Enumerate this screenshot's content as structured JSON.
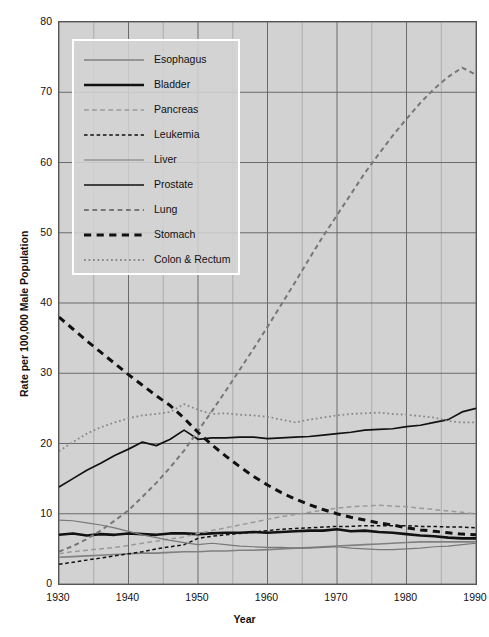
{
  "chart_data": {
    "type": "line",
    "title": "",
    "xlabel": "Year",
    "ylabel": "Rate per 100,000 Male Population",
    "xlim": [
      1930,
      1990
    ],
    "ylim": [
      0,
      80
    ],
    "xticks": [
      "1930",
      "1940",
      "1950",
      "1960",
      "1970",
      "1980",
      "1990"
    ],
    "yticks": [
      "0",
      "10",
      "20",
      "30",
      "40",
      "50",
      "60",
      "70",
      "80"
    ],
    "x_minor_step": 5,
    "grid": true,
    "legend_position": "upper-left",
    "background_color": "#d2d2d2",
    "grid_color": "#6a6a6a",
    "x": [
      1930,
      1932,
      1934,
      1936,
      1938,
      1940,
      1942,
      1944,
      1946,
      1948,
      1950,
      1952,
      1954,
      1956,
      1958,
      1960,
      1962,
      1964,
      1966,
      1968,
      1970,
      1972,
      1974,
      1976,
      1978,
      1980,
      1982,
      1984,
      1986,
      1988,
      1990
    ],
    "series": [
      {
        "name": "Esophagus",
        "style": "solid",
        "width": 1.6,
        "color": "#808080",
        "values": [
          3.8,
          3.9,
          4.0,
          4.1,
          4.2,
          4.3,
          4.4,
          4.4,
          4.5,
          4.6,
          4.6,
          4.7,
          4.7,
          4.8,
          4.8,
          4.9,
          5.0,
          5.1,
          5.2,
          5.3,
          5.4,
          5.5,
          5.6,
          5.7,
          5.8,
          5.9,
          6.0,
          6.0,
          6.0,
          6.0,
          6.0
        ]
      },
      {
        "name": "Bladder",
        "style": "solid",
        "width": 2.6,
        "color": "#111111",
        "values": [
          7.0,
          7.2,
          6.9,
          7.1,
          7.0,
          7.2,
          7.1,
          7.0,
          7.2,
          7.2,
          7.1,
          7.2,
          7.3,
          7.3,
          7.4,
          7.3,
          7.4,
          7.5,
          7.6,
          7.6,
          7.8,
          7.5,
          7.6,
          7.4,
          7.3,
          7.1,
          6.9,
          6.8,
          6.6,
          6.5,
          6.5
        ]
      },
      {
        "name": "Pancreas",
        "style": "dashed-thin",
        "width": 1.5,
        "color": "#9a9a9a",
        "values": [
          4.3,
          4.6,
          4.8,
          5.0,
          5.2,
          5.5,
          5.8,
          6.1,
          6.4,
          6.7,
          7.2,
          7.6,
          8.0,
          8.4,
          8.8,
          9.2,
          9.6,
          9.9,
          10.2,
          10.5,
          10.8,
          11.0,
          11.1,
          11.2,
          11.1,
          11.0,
          10.8,
          10.6,
          10.4,
          10.2,
          10.0
        ]
      },
      {
        "name": "Leukemia",
        "style": "dashed",
        "width": 1.5,
        "color": "#111111",
        "values": [
          2.8,
          3.1,
          3.4,
          3.7,
          4.0,
          4.3,
          4.6,
          5.0,
          5.3,
          5.6,
          6.5,
          6.8,
          7.0,
          7.2,
          7.4,
          7.6,
          7.8,
          7.9,
          8.0,
          8.1,
          8.2,
          8.2,
          8.3,
          8.3,
          8.3,
          8.3,
          8.2,
          8.2,
          8.1,
          8.1,
          8.0
        ]
      },
      {
        "name": "Liver",
        "style": "solid",
        "width": 1.2,
        "color": "#787878",
        "values": [
          9.1,
          9.0,
          8.7,
          8.4,
          8.0,
          7.5,
          7.0,
          6.6,
          6.2,
          5.9,
          5.6,
          5.8,
          5.6,
          5.4,
          5.3,
          5.2,
          5.2,
          5.1,
          5.1,
          5.2,
          5.3,
          5.1,
          5.0,
          4.9,
          4.9,
          5.0,
          5.1,
          5.3,
          5.4,
          5.6,
          5.8
        ]
      },
      {
        "name": "Prostate",
        "style": "solid",
        "width": 1.7,
        "color": "#111111",
        "values": [
          13.8,
          15.0,
          16.2,
          17.2,
          18.3,
          19.2,
          20.2,
          19.7,
          20.6,
          21.9,
          20.6,
          20.8,
          20.8,
          20.9,
          20.9,
          20.7,
          20.8,
          20.9,
          21.0,
          21.2,
          21.4,
          21.6,
          21.9,
          22.0,
          22.1,
          22.4,
          22.6,
          23.0,
          23.4,
          24.5,
          25.0
        ]
      },
      {
        "name": "Lung",
        "style": "dashed",
        "width": 2.0,
        "color": "#777777",
        "values": [
          4.6,
          5.4,
          6.4,
          7.6,
          9.0,
          10.5,
          12.4,
          14.4,
          16.6,
          19.0,
          21.8,
          24.6,
          27.5,
          30.5,
          33.5,
          36.6,
          39.8,
          43.0,
          46.3,
          49.5,
          52.5,
          55.5,
          58.5,
          61.2,
          63.8,
          66.2,
          68.5,
          70.5,
          72.2,
          73.5,
          72.5
        ]
      },
      {
        "name": "Stomach",
        "style": "dashed",
        "width": 3.0,
        "color": "#111111",
        "values": [
          38.0,
          36.3,
          34.6,
          33.0,
          31.4,
          29.8,
          28.3,
          26.8,
          25.4,
          23.6,
          21.6,
          19.8,
          18.2,
          16.7,
          15.3,
          14.1,
          13.0,
          12.1,
          11.3,
          10.6,
          10.0,
          9.5,
          9.1,
          8.7,
          8.4,
          8.0,
          7.7,
          7.5,
          7.3,
          7.1,
          7.0
        ]
      },
      {
        "name": "Colon & Rectum",
        "style": "dotted",
        "width": 1.8,
        "color": "#8a8a8a",
        "values": [
          18.9,
          20.2,
          21.4,
          22.3,
          23.0,
          23.6,
          24.0,
          24.2,
          24.5,
          25.6,
          24.8,
          24.2,
          24.3,
          24.1,
          24.0,
          23.8,
          23.4,
          23.0,
          23.4,
          23.7,
          24.0,
          24.2,
          24.3,
          24.4,
          24.2,
          24.1,
          23.9,
          23.7,
          23.2,
          23.0,
          23.0
        ]
      }
    ]
  },
  "axis": {
    "y_title": "Rate per 100,000 Male Population",
    "x_title": "Year"
  }
}
